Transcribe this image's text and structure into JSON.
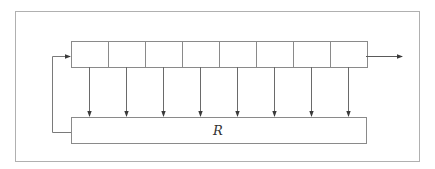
{
  "diagram": {
    "type": "feedback-shift-register",
    "colors": {
      "stroke": "#8a8a8a",
      "frame": "#b0b0b0",
      "arrow": "#3a3a3a",
      "text": "#333333",
      "background": "#ffffff"
    },
    "frame": {
      "x": 15,
      "y": 11,
      "width": 405,
      "height": 151
    },
    "register": {
      "x": 71,
      "y": 41,
      "height": 26,
      "cell_count": 8,
      "cell_width": 37
    },
    "function_box": {
      "label": "R",
      "x": 71,
      "y": 117,
      "width": 295,
      "height": 26
    },
    "tap_arrows_x": [
      89,
      126,
      163,
      200,
      237,
      274,
      311,
      348
    ],
    "feedback": {
      "left_x": 52,
      "from_y": 132,
      "to_y": 56
    },
    "output": {
      "from_x": 366,
      "to_x": 402,
      "y": 56
    }
  }
}
